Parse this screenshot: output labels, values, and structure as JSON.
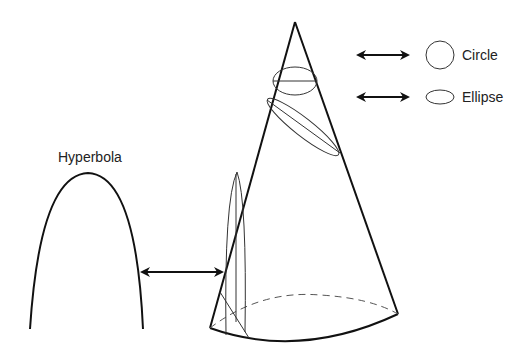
{
  "diagram": {
    "labels": {
      "circle": "Circle",
      "ellipse": "Ellipse",
      "hyperbola": "Hyperbola"
    },
    "elements": [
      {
        "id": "cone",
        "description": "Right circular cone with apex at top and elliptical (perspective) base, back half dashed"
      },
      {
        "id": "circle-section",
        "description": "Horizontal plane cut near apex producing a circle"
      },
      {
        "id": "ellipse-section",
        "description": "Tilted plane cut producing an ellipse"
      },
      {
        "id": "hyperbola-section",
        "description": "Vertical plane cut producing a hyperbola branch"
      },
      {
        "id": "arrow-circle",
        "description": "Double-headed arrow linking circle cut to circle shape"
      },
      {
        "id": "arrow-ellipse",
        "description": "Double-headed arrow linking ellipse cut to ellipse shape"
      },
      {
        "id": "arrow-hyperbola",
        "description": "Double-headed arrow linking hyperbola cut to hyperbola curve"
      }
    ],
    "colors": {
      "stroke": "#111111",
      "background": "#ffffff"
    }
  }
}
